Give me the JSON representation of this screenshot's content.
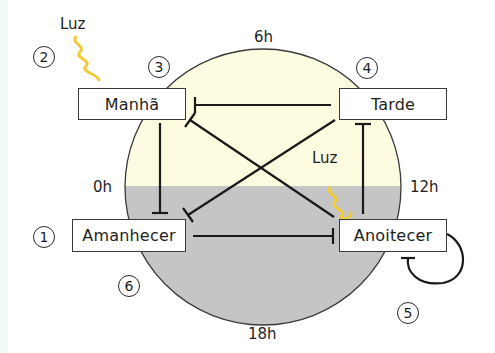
{
  "colors": {
    "day": "#fdfbe0",
    "night": "#c5c5c5",
    "light_wave": "#f2cc38",
    "line": "#1a1a1a"
  },
  "time_labels": {
    "top": "6h",
    "left": "0h",
    "right": "12h",
    "bottom": "18h"
  },
  "nodes": {
    "manha": "Manhã",
    "tarde": "Tarde",
    "amanhecer": "Amanhecer",
    "anoitecer": "Anoitecer"
  },
  "light_labels": {
    "outer": "Luz",
    "inner": "Luz"
  },
  "steps": [
    "1",
    "2",
    "3",
    "4",
    "5",
    "6"
  ],
  "edges": [
    {
      "from": "Tarde",
      "to": "Manhã",
      "type": "inhibition"
    },
    {
      "from": "Manhã",
      "to": "Amanhecer",
      "type": "inhibition"
    },
    {
      "from": "Anoitecer",
      "to": "Manhã",
      "type": "inhibition"
    },
    {
      "from": "Tarde",
      "to": "Amanhecer",
      "type": "inhibition"
    },
    {
      "from": "Amanhecer",
      "to": "Tarde",
      "type": "inhibition"
    },
    {
      "from": "Anoitecer",
      "to": "Tarde",
      "type": "inhibition"
    },
    {
      "from": "Amanhecer",
      "to": "Anoitecer",
      "type": "inhibition"
    },
    {
      "from": "Anoitecer",
      "to": "Anoitecer",
      "type": "self-inhibition"
    }
  ]
}
